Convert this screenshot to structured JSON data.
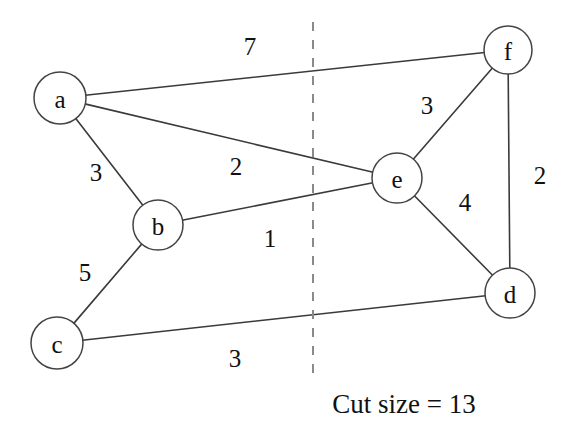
{
  "figure": {
    "caption": "Cut size = 13",
    "background_color": "#ffffff",
    "edge_color": "#3a3a3a",
    "node_fill_color": "#ffffff",
    "node_stroke_color": "#444444",
    "cut_line_color": "#8a8a8a"
  },
  "chart_data": {
    "type": "diagram",
    "title": "Cut size = 13",
    "diagram_kind": "weighted-undirected-graph-with-cut",
    "nodes": [
      {
        "id": "a",
        "label": "a",
        "x": 60,
        "y": 98,
        "r": 26,
        "partition": "left"
      },
      {
        "id": "b",
        "label": "b",
        "x": 158,
        "y": 225,
        "r": 25,
        "partition": "left"
      },
      {
        "id": "c",
        "label": "c",
        "x": 57,
        "y": 343,
        "r": 26,
        "partition": "left"
      },
      {
        "id": "d",
        "label": "d",
        "x": 510,
        "y": 293,
        "r": 25,
        "partition": "right"
      },
      {
        "id": "e",
        "label": "e",
        "x": 397,
        "y": 178,
        "r": 25,
        "partition": "right"
      },
      {
        "id": "f",
        "label": "f",
        "x": 508,
        "y": 50,
        "r": 24,
        "partition": "right"
      }
    ],
    "edges": [
      {
        "source": "a",
        "target": "f",
        "weight": 7,
        "label": "7",
        "label_x": 250,
        "label_y": 46,
        "crosses_cut": true
      },
      {
        "source": "a",
        "target": "b",
        "weight": 3,
        "label": "3",
        "label_x": 96,
        "label_y": 172,
        "crosses_cut": false
      },
      {
        "source": "a",
        "target": "e",
        "weight": 2,
        "label": "2",
        "label_x": 236,
        "label_y": 166,
        "crosses_cut": true
      },
      {
        "source": "b",
        "target": "e",
        "weight": 1,
        "label": "1",
        "label_x": 270,
        "label_y": 238,
        "crosses_cut": true
      },
      {
        "source": "b",
        "target": "c",
        "weight": 5,
        "label": "5",
        "label_x": 85,
        "label_y": 272,
        "crosses_cut": false
      },
      {
        "source": "c",
        "target": "d",
        "weight": 3,
        "label": "3",
        "label_x": 235,
        "label_y": 358,
        "crosses_cut": true
      },
      {
        "source": "e",
        "target": "f",
        "weight": 3,
        "label": "3",
        "label_x": 427,
        "label_y": 105,
        "crosses_cut": false
      },
      {
        "source": "e",
        "target": "d",
        "weight": 4,
        "label": "4",
        "label_x": 465,
        "label_y": 202,
        "crosses_cut": false
      },
      {
        "source": "f",
        "target": "d",
        "weight": 2,
        "label": "2",
        "label_x": 540,
        "label_y": 175,
        "crosses_cut": false
      }
    ],
    "cut_line": {
      "x": 313,
      "y_top": 22,
      "y_bottom": 380,
      "style": "dashed"
    },
    "cut_size": 13,
    "cut_edges": [
      "a-f",
      "a-e",
      "b-e",
      "c-d"
    ],
    "caption_position": {
      "x": 404,
      "y": 404
    }
  }
}
